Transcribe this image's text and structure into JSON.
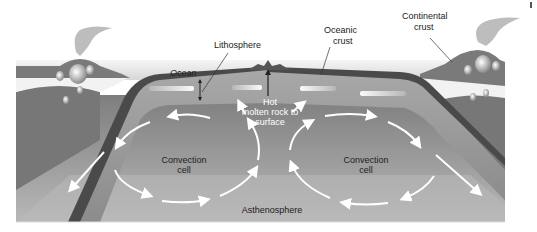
{
  "diagram": {
    "labels": {
      "lithosphere": "Lithosphere",
      "ocean": "Ocean",
      "oceanic_crust_line1": "Oceanic",
      "oceanic_crust_line2": "crust",
      "continental_crust_line1": "Continental",
      "continental_crust_line2": "crust",
      "hot_rock_line1": "Hot",
      "hot_rock_line2": "molten rock to",
      "hot_rock_line3": "surface",
      "convection_left_line1": "Convection",
      "convection_left_line2": "cell",
      "convection_right_line1": "Convection",
      "convection_right_line2": "cell",
      "asthenosphere": "Asthenosphere"
    },
    "colors": {
      "sky": "#e4e4e4",
      "ocean_surface": "#b8b8b8",
      "crust_dark": "#4a4a4a",
      "lithosphere": "#9a9a9a",
      "asthenosphere_top": "#8a8a8a",
      "asthenosphere_bottom": "#b4b4b4",
      "continent": "#7c7c7c",
      "magma_gap": "#f4f4f4",
      "arrow": "#ffffff",
      "label_text": "#222222"
    }
  }
}
